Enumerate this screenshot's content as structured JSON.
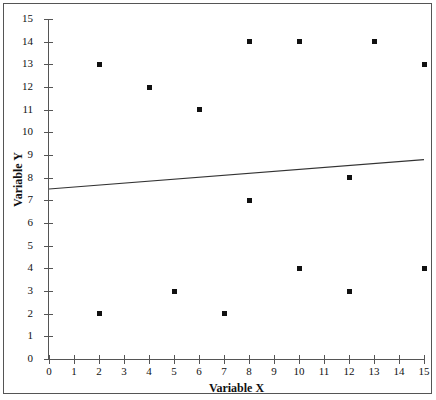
{
  "chart_data": {
    "type": "scatter",
    "title": "",
    "xlabel": "Variable X",
    "ylabel": "Variable Y",
    "xlim": [
      0,
      15
    ],
    "ylim": [
      0,
      15
    ],
    "grid": false,
    "legend": null,
    "x_ticks": [
      "0",
      "1",
      "2",
      "3",
      "4",
      "5",
      "6",
      "7",
      "8",
      "9",
      "10",
      "11",
      "12",
      "13",
      "14",
      "15"
    ],
    "y_ticks": [
      "0",
      "1",
      "2",
      "3",
      "4",
      "5",
      "6",
      "7",
      "8",
      "9",
      "10",
      "11",
      "12",
      "13",
      "14",
      "15"
    ],
    "points": [
      {
        "x": 2,
        "y": 13
      },
      {
        "x": 2,
        "y": 2
      },
      {
        "x": 4,
        "y": 12
      },
      {
        "x": 5,
        "y": 3
      },
      {
        "x": 6,
        "y": 11
      },
      {
        "x": 7,
        "y": 2
      },
      {
        "x": 8,
        "y": 14
      },
      {
        "x": 8,
        "y": 7
      },
      {
        "x": 10,
        "y": 14
      },
      {
        "x": 10,
        "y": 4
      },
      {
        "x": 12,
        "y": 8
      },
      {
        "x": 12,
        "y": 3
      },
      {
        "x": 13,
        "y": 14
      },
      {
        "x": 15,
        "y": 13
      },
      {
        "x": 15,
        "y": 4
      }
    ],
    "trend_line": {
      "x0": 0,
      "y0": 7.5,
      "x1": 15,
      "y1": 8.8,
      "color": "#333333"
    },
    "marker_color": "#111111",
    "axis_color": "#555555"
  }
}
